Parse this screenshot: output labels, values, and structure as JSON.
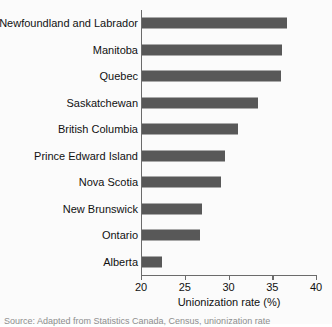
{
  "chart_data": {
    "type": "bar",
    "orientation": "horizontal",
    "title": "",
    "subtitle": "",
    "xlabel": "Unionization rate (%)",
    "ylabel": "",
    "xlim": [
      20,
      40
    ],
    "xticks": [
      20,
      25,
      30,
      35,
      40
    ],
    "xtick_labels": [
      "20",
      "25",
      "30",
      "35",
      "40"
    ],
    "grid": false,
    "legend": false,
    "legend_position": "none",
    "bar_color": "#585858",
    "axis_color": "#6b6b6b",
    "categories": [
      "Newfoundland and Labrador",
      "Manitoba",
      "Quebec",
      "Saskatchewan",
      "British Columbia",
      "Prince Edward Island",
      "Nova Scotia",
      "New Brunswick",
      "Ontario",
      "Alberta"
    ],
    "values": [
      36.7,
      36.1,
      36.0,
      33.4,
      31.1,
      29.6,
      29.1,
      27.0,
      26.7,
      22.4
    ]
  },
  "caption": {
    "source": "Source: Adapted from Statistics Canada, Census, unionization rate"
  }
}
